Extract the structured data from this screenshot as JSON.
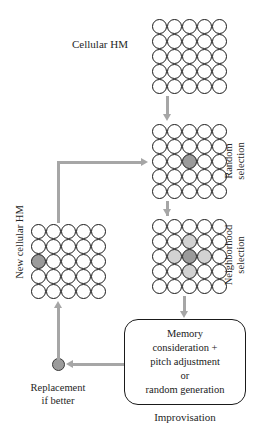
{
  "diagram": {
    "colors": {
      "connector": "#a6a6a6",
      "cell_stroke": "#1a1a1a",
      "cell_fill": "#ffffff",
      "selected_fill": "#9b9b9b",
      "neighbor_fill": "#d2d2d2",
      "box_stroke": "#1a1a1a",
      "text": "#262626"
    },
    "labels": {
      "cellular_hm": "Cellular HM",
      "new_cellular_hm": "New cellular HM",
      "random_selection": "Random\nselection",
      "random_selection_lines": [
        "Random",
        "selection"
      ],
      "neighborhood_selection": "Neighborhood\nselection",
      "neighborhood_selection_lines": [
        "Neighborhood",
        "selection"
      ],
      "replacement_if_better": "Replacement\nif better",
      "improvisation": "Improvisation"
    },
    "improvisation_box": {
      "lines": [
        "Memory",
        "consideration +",
        "pitch adjustment",
        "or",
        "random generation"
      ],
      "text": "Memory consideration + pitch adjustment or random generation"
    },
    "grids": [
      {
        "id": "cellular-hm",
        "name": "Cellular HM",
        "rows": 5,
        "cols": 5,
        "states": [
          [
            "empty",
            "empty",
            "empty",
            "empty",
            "empty"
          ],
          [
            "empty",
            "empty",
            "empty",
            "empty",
            "empty"
          ],
          [
            "empty",
            "empty",
            "empty",
            "empty",
            "empty"
          ],
          [
            "empty",
            "empty",
            "empty",
            "empty",
            "empty"
          ],
          [
            "empty",
            "empty",
            "empty",
            "empty",
            "empty"
          ]
        ]
      },
      {
        "id": "random-selection",
        "name": "Random selection",
        "rows": 5,
        "cols": 5,
        "states": [
          [
            "empty",
            "empty",
            "empty",
            "empty",
            "empty"
          ],
          [
            "empty",
            "empty",
            "empty",
            "empty",
            "empty"
          ],
          [
            "empty",
            "empty",
            "selected",
            "empty",
            "empty"
          ],
          [
            "empty",
            "empty",
            "empty",
            "empty",
            "empty"
          ],
          [
            "empty",
            "empty",
            "empty",
            "empty",
            "empty"
          ]
        ]
      },
      {
        "id": "neighborhood-selection",
        "name": "Neighborhood selection",
        "rows": 5,
        "cols": 5,
        "states": [
          [
            "empty",
            "empty",
            "empty",
            "empty",
            "empty"
          ],
          [
            "empty",
            "empty",
            "neighbor",
            "empty",
            "empty"
          ],
          [
            "empty",
            "neighbor",
            "selected",
            "neighbor",
            "empty"
          ],
          [
            "empty",
            "empty",
            "neighbor",
            "empty",
            "empty"
          ],
          [
            "empty",
            "empty",
            "empty",
            "empty",
            "empty"
          ]
        ]
      },
      {
        "id": "new-cellular-hm",
        "name": "New cellular HM",
        "rows": 5,
        "cols": 5,
        "states": [
          [
            "empty",
            "empty",
            "empty",
            "empty",
            "empty"
          ],
          [
            "empty",
            "empty",
            "empty",
            "empty",
            "empty"
          ],
          [
            "selected",
            "empty",
            "empty",
            "empty",
            "empty"
          ],
          [
            "empty",
            "empty",
            "empty",
            "empty",
            "empty"
          ],
          [
            "empty",
            "empty",
            "empty",
            "empty",
            "empty"
          ]
        ]
      }
    ]
  }
}
